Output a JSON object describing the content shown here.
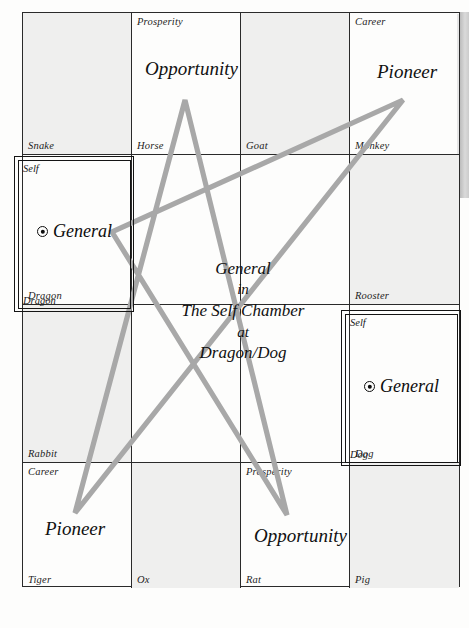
{
  "diagram": {
    "title": "General in The Self Chamber at Dragon/Dog",
    "star_color": "#a6a6a6",
    "grid_line_color": "#2a2a2a",
    "shade_color": "#efefee"
  },
  "grid": {
    "rows": [
      [
        {
          "branch": "Snake",
          "corner": "",
          "big": "",
          "shaded": true
        },
        {
          "branch": "Horse",
          "corner": "Prosperity",
          "big": "Opportunity",
          "shaded": false
        },
        {
          "branch": "Goat",
          "corner": "",
          "big": "",
          "shaded": true
        },
        {
          "branch": "Monkey",
          "corner": "Career",
          "big": "Pioneer",
          "shaded": false
        }
      ],
      [
        {
          "branch": "Dragon",
          "corner": "Self",
          "big": "General",
          "shaded": false
        },
        {
          "branch": "Goat2",
          "corner": "",
          "big": "",
          "shaded": false
        },
        {
          "branch": "",
          "corner": "",
          "big": "",
          "shaded": false
        },
        {
          "branch": "Rooster",
          "corner": "",
          "big": "",
          "shaded": true
        }
      ],
      [
        {
          "branch": "Rabbit",
          "corner": "",
          "big": "",
          "shaded": true
        },
        {
          "branch": "",
          "corner": "",
          "big": "",
          "shaded": false
        },
        {
          "branch": "",
          "corner": "",
          "big": "",
          "shaded": false
        },
        {
          "branch": "Dog",
          "corner": "Self",
          "big": "General",
          "shaded": false
        }
      ],
      [
        {
          "branch": "Tiger",
          "corner": "Career",
          "big": "Pioneer",
          "shaded": false
        },
        {
          "branch": "Ox",
          "corner": "",
          "big": "",
          "shaded": true
        },
        {
          "branch": "Rat",
          "corner": "Prosperity",
          "big": "Opportunity",
          "shaded": false
        },
        {
          "branch": "Pig",
          "corner": "",
          "big": "",
          "shaded": true
        }
      ]
    ],
    "labels": {
      "r1c1_branch": "Snake",
      "r1c2_branch": "Horse",
      "r1c2_corner": "Prosperity",
      "r1c2_big": "Opportunity",
      "r1c3_branch": "Goat",
      "r1c4_branch": "Monkey",
      "r1c4_corner": "Career",
      "r1c4_big": "Pioneer",
      "r2c1_branch": "Dragon",
      "r2c4_branch": "Rooster",
      "r3c1_branch": "Rabbit",
      "r3c4_branch": "Dog",
      "r4c1_branch": "Tiger",
      "r4c1_corner": "Career",
      "r4c1_big": "Pioneer",
      "r4c2_branch": "Ox",
      "r4c3_branch": "Rat",
      "r4c3_corner": "Prosperity",
      "r4c3_big": "Opportunity",
      "r4c4_branch": "Pig"
    }
  },
  "chambers": {
    "left": {
      "self_label": "Self",
      "branch_label": "Dragon",
      "general_label": "General",
      "marker": "circled-dot-icon"
    },
    "right": {
      "self_label": "Self",
      "branch_label": "Dog",
      "general_label": "General",
      "marker": "circled-dot-icon"
    }
  },
  "center_caption": {
    "line1": "General",
    "line2": "in",
    "line3": "The Self Chamber",
    "line4": "at",
    "line5": "Dragon/Dog"
  }
}
